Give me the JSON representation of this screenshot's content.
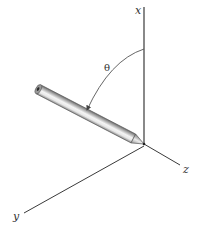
{
  "diagram": {
    "type": "3d-coordinate-axes",
    "axes": {
      "x_label": "x",
      "y_label": "y",
      "z_label": "z"
    },
    "angle_label": "θ",
    "colors": {
      "axis_line": "#3a3a3a",
      "arc": "#555555",
      "rod_light": "#f0f0f0",
      "rod_mid": "#bdbdbd",
      "rod_dark": "#6e6e6e",
      "label": "#333333"
    }
  }
}
